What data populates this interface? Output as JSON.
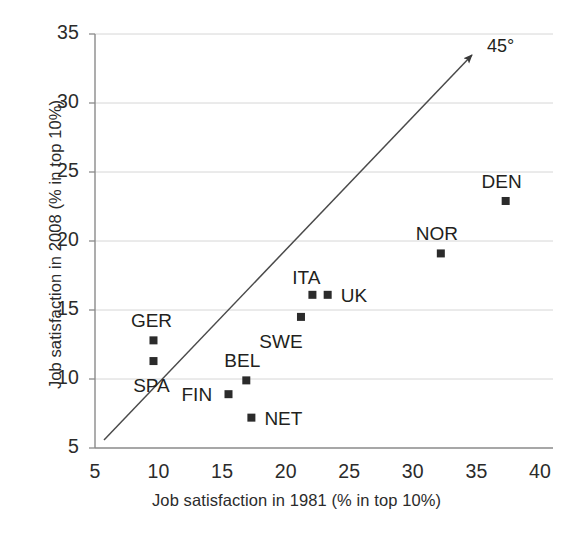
{
  "chart_data": {
    "type": "scatter",
    "title": "",
    "xlabel": "Job satisfaction in 1981 (% in top 10%)",
    "ylabel": "Job satisfaction in 2008 (% in top 10%)",
    "xlim": [
      5,
      40
    ],
    "ylim": [
      5,
      35
    ],
    "xticks": [
      "5",
      "10",
      "15",
      "20",
      "25",
      "30",
      "35",
      "40"
    ],
    "yticks": [
      "5",
      "10",
      "15",
      "20",
      "25",
      "30",
      "35"
    ],
    "xtick_values": [
      5,
      10,
      15,
      20,
      25,
      30,
      35,
      40
    ],
    "ytick_values": [
      5,
      10,
      15,
      20,
      25,
      30,
      35
    ],
    "grid": "horizontal",
    "legend": "none",
    "marker": "square",
    "marker_color": "#2b2b2b",
    "points": [
      {
        "label": "GER",
        "x": 9.6,
        "y": 12.8,
        "label_dx": -4,
        "label_dy": -30
      },
      {
        "label": "SPA",
        "x": 9.6,
        "y": 11.3,
        "label_dx": -4,
        "label_dy": 14
      },
      {
        "label": "FIN",
        "x": 15.5,
        "y": 8.9,
        "label_dx": -47,
        "label_dy": -10
      },
      {
        "label": "BEL",
        "x": 16.9,
        "y": 9.9,
        "label_dx": -6,
        "label_dy": -30
      },
      {
        "label": "NET",
        "x": 17.3,
        "y": 7.2,
        "label_dx": 13,
        "label_dy": -10
      },
      {
        "label": "SWE",
        "x": 21.2,
        "y": 14.5,
        "label_dx": -22,
        "label_dy": 14
      },
      {
        "label": "ITA",
        "x": 22.1,
        "y": 16.1,
        "label_dx": -8,
        "label_dy": -28
      },
      {
        "label": "UK",
        "x": 23.3,
        "y": 16.1,
        "label_dx": 13,
        "label_dy": -10
      },
      {
        "label": "NOR",
        "x": 32.2,
        "y": 19.1,
        "label_dx": -6,
        "label_dy": -30
      },
      {
        "label": "DEN",
        "x": 37.3,
        "y": 22.9,
        "label_dx": -6,
        "label_dy": -30
      }
    ],
    "annotations": [
      {
        "name": "forty-five-degree-line",
        "text": "45°",
        "line_from": [
          5.7,
          5.6
        ],
        "line_to": [
          34.9,
          33.8
        ],
        "arrow": "end"
      }
    ]
  },
  "axes": {
    "x_title": "Job satisfaction in 1981 (% in top 10%)",
    "y_title": "Job satisfaction in 2008 (% in top 10%)"
  },
  "colors": {
    "marker": "#2b2b2b",
    "axis": "#7b7b7b",
    "grid": "#d6d6d6",
    "text": "#231f20",
    "background": "#ffffff"
  }
}
